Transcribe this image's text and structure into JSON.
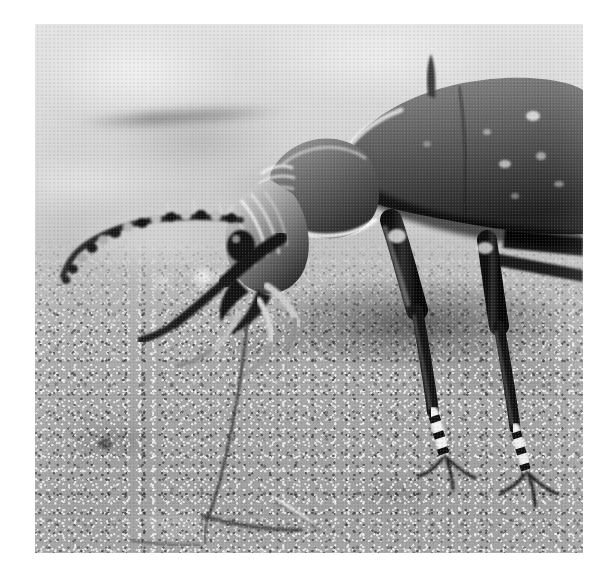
{
  "page": {
    "background_color": "#ffffff",
    "caption": "",
    "width": 616,
    "height": 575
  },
  "photograph": {
    "name": "ground-beetle-macro-photograph",
    "subject": "ground beetle (Carabidae) standing on sandy soil",
    "color_mode": "black-and-white",
    "orientation": "landscape-square",
    "alt_text": "Close-up black and white photograph of a ground beetle on sandy ground, facing left, with one long segmented antenna sweeping forward",
    "frame": {
      "left": 35,
      "top": 24,
      "width": 548,
      "height": 529
    },
    "tones": {
      "paper_white": "#ffffff",
      "background_light": "#dcdcdc",
      "background_mid": "#c4c4c4",
      "ground_mid": "#a8a8a8",
      "ground_dark": "#8f8f8f",
      "carapace_mid": "#6a6a6a",
      "carapace_dark": "#3a3a3a",
      "shadow_black": "#151515",
      "highlight_white": "#f2f2f2"
    },
    "regions": [
      {
        "name": "blurred-background",
        "description": "out-of-focus pale grey upper area"
      },
      {
        "name": "blurred-twig",
        "description": "soft horizontal stick shape in upper left background"
      },
      {
        "name": "bokeh-pebbles",
        "description": "row of blurred round light pebbles mid-left"
      },
      {
        "name": "sandy-ground",
        "description": "granular in-focus soil occupying lower two thirds"
      },
      {
        "name": "ground-debris",
        "description": "small dark twig and pale grass blade on the soil lower centre"
      }
    ],
    "subject_parts": [
      {
        "name": "elytra",
        "label": "wing cases",
        "description": "large textured domed shells at upper right with pale speckle highlights"
      },
      {
        "name": "pronotum",
        "label": "thorax shield",
        "description": "heart-shaped plate with bright rim between head and elytra"
      },
      {
        "name": "head",
        "label": "head",
        "description": "sculpted head with ridges at centre left, facing downward-left"
      },
      {
        "name": "mandibles",
        "label": "mandibles",
        "description": "dark curved jaws below the head"
      },
      {
        "name": "maxillary-palps",
        "label": "palps",
        "description": "pale segmented mouth feelers projecting forward and down"
      },
      {
        "name": "antenna-left",
        "label": "antenna",
        "description": "long beaded segmented antenna curving left across the frame"
      },
      {
        "name": "antenna-trailing",
        "label": "trailing antenna",
        "description": "fine hair-thin antenna sweeping down to the lower centre of the frame"
      },
      {
        "name": "foreleg",
        "label": "foreleg",
        "description": "dark leg stepping forward under the head"
      },
      {
        "name": "midleg",
        "label": "middle leg",
        "description": "long leg with banded tarsus planted at lower centre right"
      },
      {
        "name": "hindleg",
        "label": "hind leg",
        "description": "long leg with banded tarsus planted at lower right"
      },
      {
        "name": "tarsal-claws",
        "label": "claws",
        "description": "fine paired claws at the tips of the feet"
      }
    ]
  }
}
